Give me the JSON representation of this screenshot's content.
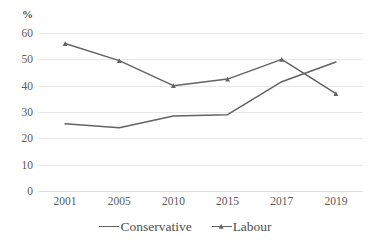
{
  "chart_data": {
    "type": "line",
    "title": "",
    "xlabel": "",
    "ylabel": "%",
    "categories": [
      "2001",
      "2005",
      "2010",
      "2015",
      "2017",
      "2019"
    ],
    "ylim": [
      0,
      60
    ],
    "yticks": [
      0,
      10,
      20,
      30,
      40,
      50,
      60
    ],
    "ytick_labels": [
      "0",
      "10",
      "20",
      "30",
      "40",
      "50",
      "60"
    ],
    "grid": true,
    "legend_position": "bottom",
    "series": [
      {
        "name": "Conservative",
        "marker": "none",
        "color": "#636363",
        "values": [
          25.5,
          24,
          28.5,
          29,
          41.5,
          49
        ]
      },
      {
        "name": "Labour",
        "marker": "triangle",
        "color": "#636363",
        "values": [
          56,
          49.5,
          40,
          42.5,
          50,
          37
        ]
      }
    ]
  },
  "axis": {
    "unit_label": "%"
  },
  "legend": {
    "items": [
      {
        "label": "Conservative",
        "marker": "line"
      },
      {
        "label": "Labour",
        "marker": "line-triangle"
      }
    ]
  },
  "colors": {
    "series_line": "#636363",
    "gridline": "#e8e8e8",
    "tick_text": "#5a5a5a",
    "background": "#ffffff"
  }
}
